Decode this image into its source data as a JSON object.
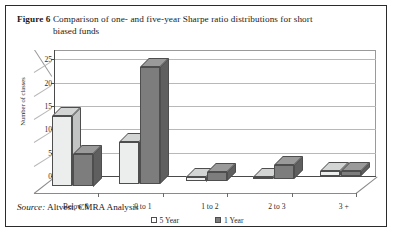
{
  "figure": {
    "label": "Figure 6",
    "caption_line1": "Comparison of one- and five-year Sharpe ratio distributions for short",
    "caption_line2": "biased funds",
    "source_label": "Source:",
    "source_text": "Altvest, CMRA Analysis"
  },
  "colors": {
    "series_5year": "#eceded",
    "series_1year": "#7d7d7d",
    "frame": "#2b2b2b",
    "gridline": "#b8b8b8",
    "axis": "#4a4a4a"
  },
  "chart_data": {
    "type": "bar",
    "title": "Comparison of one- and five-year Sharpe ratio distributions for short biased funds",
    "xlabel": "",
    "ylabel": "Number of classes",
    "categories": [
      "Below 0",
      "0 to 1",
      "1 to 2",
      "2 to 3",
      "3 +"
    ],
    "series": [
      {
        "name": "5 Year",
        "values": [
          15,
          9,
          1,
          0,
          1
        ]
      },
      {
        "name": "1 Year",
        "values": [
          7,
          25,
          2,
          3,
          1
        ]
      }
    ],
    "ylim": [
      0,
      27
    ],
    "yticks": [
      0,
      5,
      10,
      15,
      20,
      25
    ],
    "grid": true,
    "legend_position": "bottom",
    "three_d": true
  },
  "legend": {
    "items": [
      {
        "label": "5 Year",
        "swatch": "light"
      },
      {
        "label": "1 Year",
        "swatch": "dark"
      }
    ]
  }
}
